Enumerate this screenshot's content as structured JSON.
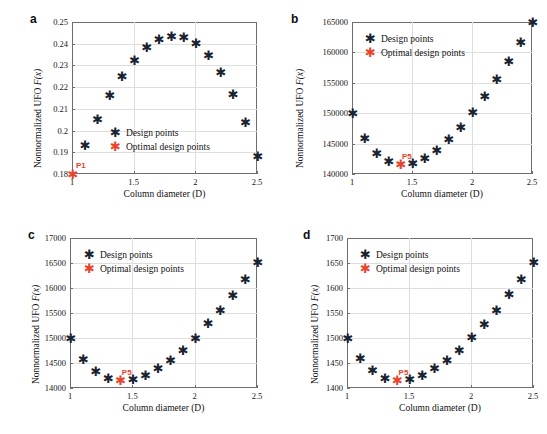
{
  "figure": {
    "marker_symbol": "✱",
    "colors": {
      "design": "#1b2330",
      "optimal": "#e8442c",
      "grid": "#dedede",
      "axis": "#6e6e6e"
    },
    "legend": {
      "design_label": "Design points",
      "optimal_label": "Optimal design points"
    },
    "xlabel": "Column diameter (D)",
    "ylabel_prefix": "Nonnormalized UFO ",
    "ylabel_math": "F(x)"
  },
  "chart_data": [
    {
      "type": "scatter",
      "panel": "a",
      "title": "",
      "xlabel": "Column diameter (D)",
      "ylabel": "Nonnormalized UFO F(x)",
      "xlim": [
        1,
        2.5
      ],
      "ylim": [
        0.18,
        0.25
      ],
      "xticks": [
        1,
        1.5,
        2,
        2.5
      ],
      "xticklabels": [
        "1",
        "1.5",
        "2",
        "2.5"
      ],
      "yticks": [
        0.18,
        0.19,
        0.2,
        0.21,
        0.22,
        0.23,
        0.24,
        0.25
      ],
      "yticklabels": [
        "0.18",
        "0.19",
        "0.2",
        "0.21",
        "0.22",
        "0.23",
        "0.24",
        "0.25"
      ],
      "grid": true,
      "legend_position": "center",
      "x": [
        1,
        1.1,
        1.2,
        1.3,
        1.4,
        1.5,
        1.6,
        1.7,
        1.8,
        1.9,
        2,
        2.1,
        2.2,
        2.3,
        2.4,
        2.5
      ],
      "values": [
        0.18,
        0.1932,
        0.2052,
        0.216,
        0.2251,
        0.2324,
        0.2382,
        0.2419,
        0.2434,
        0.2429,
        0.2401,
        0.2348,
        0.2269,
        0.2167,
        0.2036,
        0.188
      ],
      "optimal": {
        "label": "P1",
        "x": 1,
        "y": 0.18
      }
    },
    {
      "type": "scatter",
      "panel": "b",
      "title": "",
      "xlabel": "Column diameter (D)",
      "ylabel": "Nonnormalized UFO F(x)",
      "xlim": [
        1,
        2.5
      ],
      "ylim": [
        140000,
        165000
      ],
      "xticks": [
        1,
        1.5,
        2,
        2.5
      ],
      "xticklabels": [
        "1",
        "1.5",
        "2",
        "2.5"
      ],
      "yticks": [
        140000,
        145000,
        150000,
        155000,
        160000,
        165000
      ],
      "yticklabels": [
        "140000",
        "145000",
        "150000",
        "155000",
        "160000",
        "165000"
      ],
      "grid": true,
      "legend_position": "upper-left",
      "x": [
        1,
        1.1,
        1.2,
        1.3,
        1.4,
        1.5,
        1.6,
        1.7,
        1.8,
        1.9,
        2,
        2.1,
        2.2,
        2.3,
        2.4,
        2.5
      ],
      "values": [
        150000,
        145900,
        143400,
        142000,
        141500,
        141800,
        142600,
        143900,
        145650,
        147650,
        150050,
        152800,
        155550,
        158500,
        161600,
        165000
      ],
      "optimal": {
        "label": "P5",
        "x": 1.4,
        "y": 141500
      }
    },
    {
      "type": "scatter",
      "panel": "c",
      "title": "",
      "xlabel": "Column diameter (D)",
      "ylabel": "Nonnormalized UFO F(x)",
      "xlim": [
        1,
        2.5
      ],
      "ylim": [
        14000,
        17000
      ],
      "xticks": [
        1,
        1.5,
        2,
        2.5
      ],
      "xticklabels": [
        "1",
        "1.5",
        "2",
        "2.5"
      ],
      "yticks": [
        14000,
        14500,
        15000,
        15500,
        16000,
        16500,
        17000
      ],
      "yticklabels": [
        "14000",
        "14500",
        "15000",
        "15500",
        "16000",
        "16500",
        "17000"
      ],
      "grid": true,
      "legend_position": "upper-left",
      "x": [
        1,
        1.1,
        1.2,
        1.3,
        1.4,
        1.5,
        1.6,
        1.7,
        1.8,
        1.9,
        2,
        2.1,
        2.2,
        2.3,
        2.4,
        2.5
      ],
      "values": [
        15000,
        14575,
        14340,
        14200,
        14150,
        14170,
        14255,
        14385,
        14545,
        14750,
        15000,
        15290,
        15555,
        15855,
        16170,
        16510
      ],
      "optimal": {
        "label": "P5",
        "x": 1.4,
        "y": 14150
      }
    },
    {
      "type": "scatter",
      "panel": "d",
      "title": "",
      "xlabel": "Column diameter (D)",
      "ylabel": "Nonnormalized UFO F(x)",
      "xlim": [
        1,
        2.5
      ],
      "ylim": [
        1400,
        1700
      ],
      "xticks": [
        1,
        1.5,
        2,
        2.5
      ],
      "xticklabels": [
        "1",
        "1.5",
        "2",
        "2.5"
      ],
      "yticks": [
        1400,
        1450,
        1500,
        1550,
        1600,
        1650,
        1700
      ],
      "yticklabels": [
        "1400",
        "1450",
        "1500",
        "1550",
        "1600",
        "1650",
        "1700"
      ],
      "grid": true,
      "legend_position": "upper-left",
      "x": [
        1,
        1.1,
        1.2,
        1.3,
        1.4,
        1.5,
        1.6,
        1.7,
        1.8,
        1.9,
        2,
        2.1,
        2.2,
        2.3,
        2.4,
        2.5
      ],
      "values": [
        1500,
        1459,
        1435,
        1420,
        1415,
        1417,
        1426,
        1440,
        1456,
        1476,
        1501,
        1528,
        1556,
        1587,
        1618,
        1651
      ],
      "optimal": {
        "label": "P5",
        "x": 1.4,
        "y": 1415
      }
    }
  ],
  "panels": [
    {
      "letter": "a"
    },
    {
      "letter": "b"
    },
    {
      "letter": "c"
    },
    {
      "letter": "d"
    }
  ]
}
